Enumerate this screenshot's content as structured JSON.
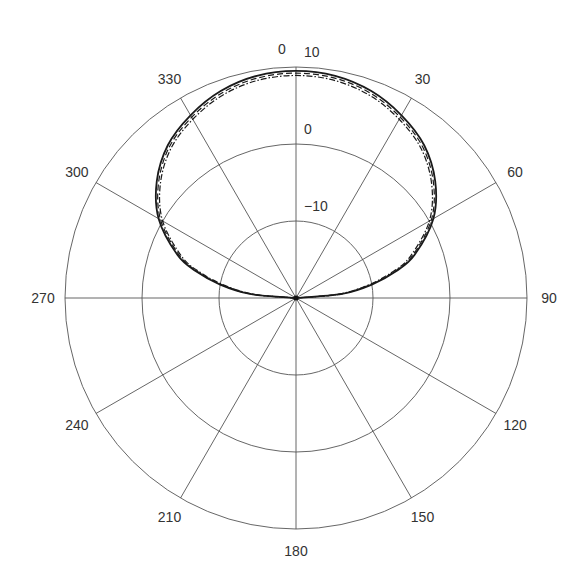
{
  "chart_data": {
    "type": "polar-line",
    "title": "",
    "angular_axis": {
      "direction": "clockwise",
      "zero_at": "top",
      "tick_labels": [
        "0",
        "30",
        "60",
        "90",
        "120",
        "150",
        "180",
        "210",
        "240",
        "270",
        "300",
        "330"
      ],
      "tick_angles_deg": [
        0,
        30,
        60,
        90,
        120,
        150,
        180,
        210,
        240,
        270,
        300,
        330
      ]
    },
    "radial_axis": {
      "unit": "dB",
      "range": [
        -20,
        10
      ],
      "rings": [
        -10,
        0,
        10
      ],
      "ring_labels": [
        "-10",
        "0",
        "10"
      ],
      "label_angle_deg": 0
    },
    "series": [
      {
        "name": "trace-1",
        "style": "solid",
        "angles_deg": [
          -90,
          -85,
          -80,
          -75,
          -70,
          -60,
          -50,
          -40,
          -30,
          -20,
          -10,
          0,
          10,
          20,
          30,
          40,
          50,
          60,
          70,
          75,
          80,
          85,
          90
        ],
        "values_db": [
          -20,
          -14,
          -10,
          -6.5,
          -3.6,
          0.6,
          3.6,
          5.9,
          7.4,
          8.6,
          9.3,
          9.5,
          9.3,
          8.6,
          7.4,
          5.9,
          3.6,
          0.6,
          -3.6,
          -6.5,
          -10,
          -14,
          -20
        ]
      },
      {
        "name": "trace-2",
        "style": "dashed",
        "angles_deg": [
          -90,
          -85,
          -80,
          -75,
          -70,
          -60,
          -50,
          -40,
          -30,
          -20,
          -10,
          0,
          10,
          20,
          30,
          40,
          50,
          60,
          70,
          75,
          80,
          85,
          90
        ],
        "values_db": [
          -20,
          -14.3,
          -10.3,
          -6.8,
          -3.9,
          0.3,
          3.3,
          5.6,
          7.1,
          8.3,
          9.0,
          9.2,
          9.0,
          8.3,
          7.1,
          5.6,
          3.3,
          0.3,
          -3.9,
          -6.8,
          -10.3,
          -14.3,
          -20
        ]
      },
      {
        "name": "trace-3",
        "style": "dash-dot",
        "angles_deg": [
          -90,
          -85,
          -80,
          -75,
          -70,
          -60,
          -50,
          -40,
          -30,
          -20,
          -10,
          0,
          10,
          20,
          30,
          40,
          50,
          60,
          70,
          75,
          80,
          85,
          90
        ],
        "values_db": [
          -20,
          -14.6,
          -10.6,
          -7.1,
          -4.2,
          0.0,
          3.0,
          5.3,
          6.8,
          8.0,
          8.7,
          8.9,
          8.7,
          8.0,
          6.8,
          5.3,
          3.0,
          0.0,
          -4.2,
          -7.1,
          -10.6,
          -14.6,
          -20
        ]
      }
    ],
    "grid": true,
    "legend": null
  },
  "layout": {
    "cx": 296,
    "cy": 298,
    "r_outer": 231,
    "label_offset": 22
  }
}
